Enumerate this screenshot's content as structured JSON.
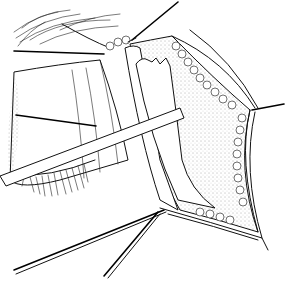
{
  "figure": {
    "colors": {
      "ink": "#111111",
      "background": "#ffffff",
      "stipple": "#555555"
    }
  }
}
